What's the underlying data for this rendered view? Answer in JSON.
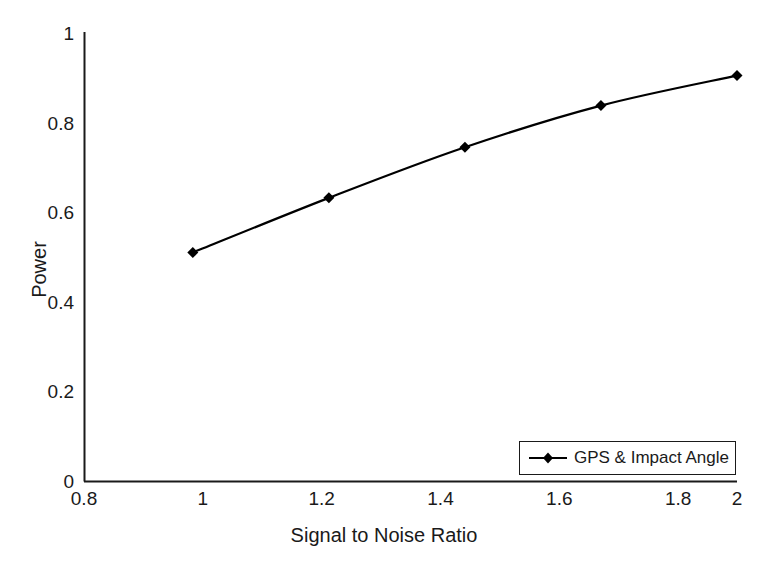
{
  "chart_data": {
    "type": "line",
    "title": "",
    "xlabel": "Signal to Noise Ratio",
    "ylabel": "Power",
    "xlim": [
      0.8,
      2.0
    ],
    "ylim": [
      0,
      1
    ],
    "xticks": [
      "0.8",
      "1",
      "1.2",
      "1.4",
      "1.6",
      "1.8",
      "2"
    ],
    "xtick_values": [
      0.8,
      1.0,
      1.2,
      1.4,
      1.6,
      1.8,
      2.0
    ],
    "yticks": [
      "0",
      "0.2",
      "0.4",
      "0.6",
      "0.8",
      "1"
    ],
    "ytick_values": [
      0,
      0.2,
      0.4,
      0.6,
      0.8,
      1
    ],
    "grid": false,
    "legend_position": "lower right",
    "x": [
      1.0,
      1.25,
      1.5,
      1.75,
      2.0
    ],
    "series": [
      {
        "name": "GPS & Impact Angle",
        "values": [
          0.51,
          0.632,
          0.745,
          0.838,
          0.905
        ],
        "marker": "diamond",
        "color": "#000000"
      }
    ],
    "annotations": []
  },
  "legend": {
    "entries": [
      {
        "label": "GPS & Impact Angle",
        "marker": "diamond-marker"
      }
    ]
  },
  "axis": {
    "x_title": "Signal to Noise Ratio",
    "y_title": "Power"
  },
  "colors": {
    "background": "#ffffff",
    "axis": "#1a1a1a",
    "series": "#000000"
  }
}
